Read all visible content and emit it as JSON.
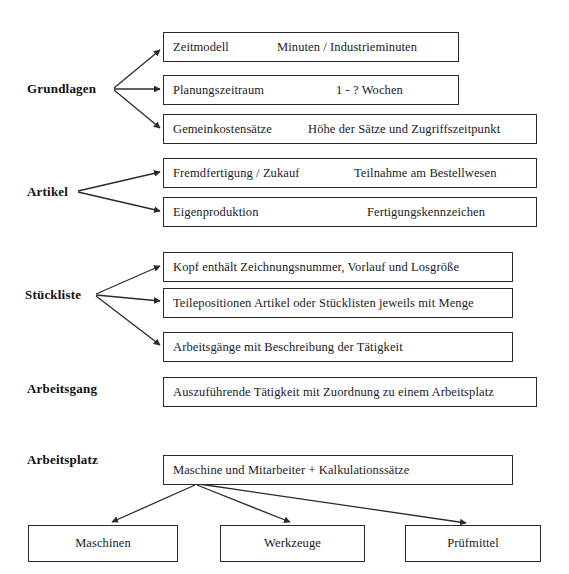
{
  "diagram": {
    "title_text": "",
    "line_color": "#2b2b2b",
    "box_border_color": "#2b2b2b",
    "text_color": "#1a1a1a",
    "background": "#ffffff",
    "groups": [
      {
        "id": "grundlagen",
        "label": "Grundlagen",
        "boxes": [
          {
            "id": "zeitmodell",
            "main": "Zeitmodell",
            "sub": "Minuten / Industrieminuten"
          },
          {
            "id": "planungszeitraum",
            "main": "Planungszeitraum",
            "sub": "1 - ? Wochen"
          },
          {
            "id": "gemeinkostensaetze",
            "main": "Gemeinkostensätze",
            "sub": "Höhe der Sätze und Zugriffszeitpunkt"
          }
        ]
      },
      {
        "id": "artikel",
        "label": "Artikel",
        "boxes": [
          {
            "id": "fremdfertigung",
            "main": "Fremdfertigung / Zukauf",
            "sub": "Teilnahme am Bestellwesen"
          },
          {
            "id": "eigenproduktion",
            "main": "Eigenproduktion",
            "sub": "Fertigungskennzeichen"
          }
        ]
      },
      {
        "id": "stueckliste",
        "label": "Stückliste",
        "boxes": [
          {
            "id": "kopf",
            "main": "Kopf enthält Zeichnungsnummer, Vorlauf und Losgröße",
            "sub": ""
          },
          {
            "id": "teilepositionen",
            "main": "Teilepositionen  Artikel oder Stücklisten jeweils mit Menge",
            "sub": ""
          },
          {
            "id": "arbeitsgaenge",
            "main": "Arbeitsgänge mit Beschreibung der Tätigkeit",
            "sub": ""
          }
        ]
      },
      {
        "id": "arbeitsgang",
        "label": "Arbeitsgang",
        "boxes": [
          {
            "id": "auszufuehrende",
            "main": "Auszuführende Tätigkeit mit Zuordnung zu einem Arbeitsplatz",
            "sub": ""
          }
        ]
      },
      {
        "id": "arbeitsplatz",
        "label": "Arbeitsplatz",
        "boxes": [
          {
            "id": "maschine_mitarbeiter",
            "main": "Maschine und Mitarbeiter + Kalkulationssätze",
            "sub": ""
          }
        ]
      }
    ],
    "leaf_boxes": [
      {
        "id": "maschinen",
        "label": "Maschinen"
      },
      {
        "id": "werkzeuge",
        "label": "Werkzeuge"
      },
      {
        "id": "pruefmittel",
        "label": "Prüfmittel"
      }
    ]
  }
}
